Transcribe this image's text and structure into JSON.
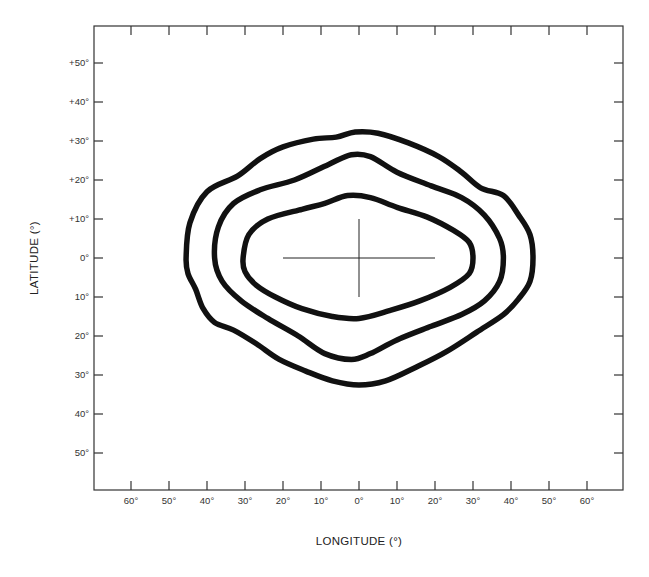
{
  "chart_data": {
    "type": "contour",
    "title": "",
    "xlabel": "LONGITUDE (°)",
    "ylabel": "LATITUDE (°)",
    "xlim": [
      -70,
      70
    ],
    "ylim": [
      -60,
      60
    ],
    "grid": false,
    "legend": null,
    "x_tick_labels": [
      "60°",
      "50°",
      "40°",
      "30°",
      "20°",
      "10°",
      "0°",
      "10°",
      "20°",
      "30°",
      "40°",
      "50°",
      "60°"
    ],
    "x_tick_values": [
      -60,
      -50,
      -40,
      -30,
      -20,
      -10,
      0,
      10,
      20,
      30,
      40,
      50,
      60
    ],
    "y_tick_labels": [
      "+50°",
      "+40°",
      "+30°",
      "+20°",
      "+10°",
      "0°",
      "10°",
      "20°",
      "30°",
      "40°",
      "50°"
    ],
    "y_tick_values": [
      50,
      40,
      30,
      20,
      10,
      0,
      -10,
      -20,
      -30,
      -40,
      -50
    ],
    "center_marker": {
      "type": "crosshair",
      "x": 0,
      "y": 0,
      "half_width_deg": 20,
      "half_height_deg": 10
    },
    "contours": [
      {
        "name": "inner",
        "extent": {
          "lon_min": -30.5,
          "lon_max": 30,
          "lat_min": -15.5,
          "lat_max": 16
        },
        "points": [
          [
            -30.5,
            0
          ],
          [
            -29,
            6
          ],
          [
            -24,
            10
          ],
          [
            -15,
            12.5
          ],
          [
            -9,
            14
          ],
          [
            -3,
            16
          ],
          [
            3,
            15.5
          ],
          [
            10,
            13
          ],
          [
            18,
            10.5
          ],
          [
            25,
            7
          ],
          [
            29,
            4
          ],
          [
            30,
            0
          ],
          [
            29,
            -4
          ],
          [
            24,
            -7.5
          ],
          [
            16,
            -11
          ],
          [
            8,
            -13.5
          ],
          [
            0,
            -15.5
          ],
          [
            -7,
            -15
          ],
          [
            -15,
            -13
          ],
          [
            -22,
            -10
          ],
          [
            -27,
            -7
          ],
          [
            -30,
            -3.5
          ]
        ]
      },
      {
        "name": "middle",
        "extent": {
          "lon_min": -38,
          "lon_max": 38,
          "lat_min": -26,
          "lat_max": 26.5
        },
        "points": [
          [
            -38,
            0
          ],
          [
            -37,
            8
          ],
          [
            -33,
            14
          ],
          [
            -26,
            17.5
          ],
          [
            -17,
            20
          ],
          [
            -8,
            24
          ],
          [
            -2,
            26.5
          ],
          [
            3,
            26
          ],
          [
            10,
            22
          ],
          [
            19,
            18.5
          ],
          [
            27,
            15.5
          ],
          [
            33,
            11
          ],
          [
            37,
            5
          ],
          [
            38,
            0
          ],
          [
            37,
            -6
          ],
          [
            33,
            -11
          ],
          [
            27,
            -14.5
          ],
          [
            19,
            -17.5
          ],
          [
            10,
            -21
          ],
          [
            3,
            -24.5
          ],
          [
            -2,
            -26
          ],
          [
            -9,
            -24.5
          ],
          [
            -16,
            -20
          ],
          [
            -24,
            -15.5
          ],
          [
            -31,
            -11
          ],
          [
            -36,
            -6
          ]
        ]
      },
      {
        "name": "outer",
        "extent": {
          "lon_min": -45.5,
          "lon_max": 45.8,
          "lat_min": -32.6,
          "lat_max": 32.3
        },
        "points": [
          [
            -45.5,
            0
          ],
          [
            -44.5,
            9
          ],
          [
            -40,
            17
          ],
          [
            -32,
            21
          ],
          [
            -26,
            25.5
          ],
          [
            -20,
            28.5
          ],
          [
            -12,
            30.5
          ],
          [
            -6,
            31
          ],
          [
            -1,
            32.3
          ],
          [
            5,
            32
          ],
          [
            13,
            29.5
          ],
          [
            21,
            26
          ],
          [
            27,
            22
          ],
          [
            32,
            18
          ],
          [
            38,
            16
          ],
          [
            42,
            11
          ],
          [
            45,
            6
          ],
          [
            45.8,
            0
          ],
          [
            45,
            -6
          ],
          [
            42,
            -10.5
          ],
          [
            38,
            -14.5
          ],
          [
            31,
            -19
          ],
          [
            23,
            -24
          ],
          [
            15,
            -28
          ],
          [
            7,
            -31.5
          ],
          [
            0,
            -32.6
          ],
          [
            -7,
            -31.5
          ],
          [
            -14,
            -29
          ],
          [
            -21,
            -26
          ],
          [
            -27,
            -22
          ],
          [
            -33,
            -18.5
          ],
          [
            -38,
            -16.5
          ],
          [
            -41,
            -13
          ],
          [
            -43,
            -8
          ],
          [
            -45,
            -4
          ]
        ]
      }
    ]
  },
  "layout": {
    "line_color": "#111111",
    "frame_color": "#333333",
    "background": "#ffffff"
  }
}
